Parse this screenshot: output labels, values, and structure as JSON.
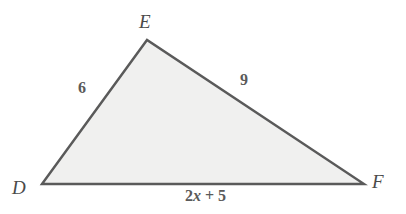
{
  "figure": {
    "type": "triangle-diagram",
    "shape_name": "triangle-DEF",
    "fill_color": "#f0f0ef",
    "stroke_color": "#5a5a5a",
    "background_color": "#ffffff",
    "vertices": [
      {
        "name": "D",
        "label": "D",
        "x": 42,
        "y": 184
      },
      {
        "name": "E",
        "label": "E",
        "x": 147,
        "y": 40
      },
      {
        "name": "F",
        "label": "F",
        "x": 364,
        "y": 184
      }
    ],
    "sides": [
      {
        "name": "DE",
        "label": "6",
        "from": "D",
        "to": "E"
      },
      {
        "name": "EF",
        "label": "9",
        "from": "E",
        "to": "F"
      },
      {
        "name": "DF",
        "label_prefix": "2",
        "label_variable": "x",
        "label_suffix": " + 5",
        "label": "2x + 5",
        "from": "D",
        "to": "F"
      }
    ]
  }
}
